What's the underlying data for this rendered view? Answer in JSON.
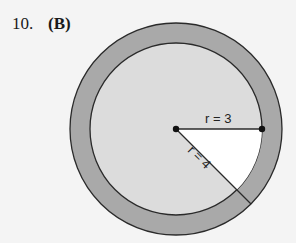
{
  "problem": {
    "number": "10.",
    "answer": "(B)"
  },
  "figure": {
    "inner_radius_label": "r = 3",
    "outer_radius_label": "r = 4",
    "colors": {
      "ring": "#a9a9a9",
      "inner_disk": "#dcdcdc",
      "sector": "#ffffff",
      "stroke": "#2a2a2a",
      "background": "#f4f4f4"
    }
  }
}
